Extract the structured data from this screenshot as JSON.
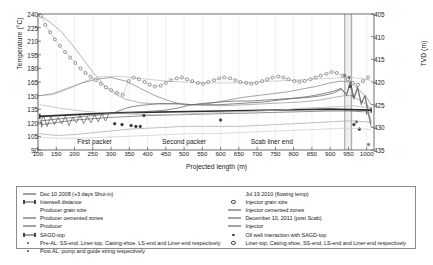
{
  "chart_data": {
    "type": "line",
    "title": "",
    "xlabel": "Projected length (m)",
    "ylabel": "Temperature (°C)",
    "y2label": "TVD (m)",
    "xlim": [
      100,
      1020
    ],
    "ylim": [
      90,
      240
    ],
    "y2lim": [
      405,
      435
    ],
    "y2_inverted": true,
    "grid": false,
    "legend_position": "below-plot-two-columns",
    "xticks": [
      100,
      150,
      200,
      250,
      300,
      350,
      400,
      450,
      500,
      550,
      600,
      650,
      700,
      750,
      800,
      850,
      900,
      950,
      1000
    ],
    "yticks": [
      90,
      105,
      120,
      135,
      150,
      165,
      180,
      195,
      210,
      225,
      240
    ],
    "y2ticks": [
      405,
      410,
      415,
      420,
      425,
      430,
      435
    ],
    "annotations": [
      {
        "text": "First packer",
        "x": 255,
        "y": 100
      },
      {
        "text": "Second packer",
        "x": 500,
        "y": 100
      },
      {
        "text": "Scab liner end",
        "x": 740,
        "y": 100
      }
    ],
    "series": [
      {
        "name": "Dec 10 2008 (+3 days Shut-in)",
        "style": "line",
        "color": "#9a9a9a",
        "x": [
          105,
          130,
          160,
          190,
          220,
          250,
          280,
          310,
          340,
          380,
          420,
          470,
          520,
          570,
          620,
          670,
          720,
          770,
          820,
          870,
          910,
          940,
          955,
          960,
          970,
          985,
          1000,
          1010
        ],
        "y": [
          238,
          232,
          222,
          208,
          192,
          176,
          162,
          152,
          146,
          142,
          141,
          141,
          140,
          139,
          139,
          140,
          141,
          142,
          143,
          145,
          148,
          150,
          150,
          149,
          147,
          144,
          140,
          136
        ]
      },
      {
        "name": "Interwell distance",
        "style": "line-with-end-caps",
        "color": "#6e6e6e",
        "x": [
          110,
          200,
          300,
          400,
          500,
          600,
          700,
          800,
          900,
          950,
          1000
        ],
        "y": [
          118,
          123,
          126,
          128,
          129,
          130,
          131,
          132,
          133,
          133,
          132
        ]
      },
      {
        "name": "Producer grain size",
        "style": "noisy-line",
        "color": "#3a3a3a",
        "x": [
          105,
          115,
          125,
          135,
          145,
          155,
          165,
          175,
          185,
          195,
          205,
          215,
          225,
          235,
          245,
          255,
          265,
          275,
          285,
          295,
          305,
          320,
          340,
          360,
          380,
          400,
          430,
          460,
          490,
          520,
          560,
          600,
          640,
          680,
          720,
          760,
          800,
          840,
          880,
          910,
          930,
          945,
          955,
          965,
          975,
          985,
          995,
          1005,
          1012
        ],
        "y": [
          118,
          128,
          116,
          127,
          118,
          126,
          119,
          127,
          117,
          126,
          120,
          128,
          119,
          127,
          120,
          129,
          121,
          130,
          122,
          131,
          130,
          133,
          136,
          138,
          139,
          140,
          141,
          141,
          141,
          140,
          140,
          140,
          141,
          142,
          143,
          145,
          147,
          149,
          152,
          155,
          158,
          150,
          166,
          148,
          160,
          142,
          150,
          132,
          120
        ]
      },
      {
        "name": "Producer cemented zones",
        "style": "line",
        "color": "#c2c2c2",
        "x": [
          105,
          140,
          170,
          200,
          230,
          260,
          280,
          290,
          300,
          330,
          360,
          400,
          450,
          500,
          550,
          600,
          650,
          700,
          750,
          800,
          850,
          900,
          940,
          960,
          1000,
          1012
        ],
        "y": [
          150,
          151,
          155,
          160,
          166,
          170,
          171,
          171,
          171,
          171,
          170,
          168,
          166,
          165,
          164,
          164,
          164,
          165,
          166,
          167,
          168,
          169,
          170,
          170,
          168,
          166
        ]
      },
      {
        "name": "Producer",
        "style": "line",
        "color": "#aaaaaa",
        "x": [
          105,
          150,
          200,
          250,
          300,
          350,
          400,
          450,
          500,
          550,
          600,
          650,
          700,
          750,
          800,
          850,
          900,
          940,
          960,
          1000,
          1012
        ],
        "y": [
          108,
          106,
          107,
          109,
          111,
          113,
          114,
          115,
          116,
          116,
          116,
          116,
          117,
          118,
          119,
          120,
          121,
          122,
          122,
          121,
          120
        ]
      },
      {
        "name": "SAGD-top",
        "style": "thick-line-with-caps",
        "color": "#2e2e2e",
        "x": [
          105,
          300,
          600,
          900,
          1012
        ],
        "y": [
          127,
          131,
          133,
          135,
          134
        ]
      },
      {
        "name": "Pre-AL: SS-end, Liner-top, Casing-shoe, LS-end and Liner-end respectively",
        "style": "markers",
        "color": "#2e2e2e",
        "x": [
          330,
          355,
          368,
          380,
          955
        ],
        "y": [
          118,
          117,
          116,
          116,
          160
        ]
      },
      {
        "name": "Post AL: pump and guide string respectively",
        "style": "markers",
        "color": "#2e2e2e",
        "x": [
          310,
          980
        ],
        "y": [
          119,
          113
        ]
      },
      {
        "name": "Jul 19 2010 (flowing temp)",
        "style": "line",
        "color": "#878787",
        "x": [
          105,
          140,
          180,
          220,
          260,
          300,
          340,
          380,
          420,
          460,
          500,
          540,
          580,
          620,
          660,
          700,
          740,
          780,
          820,
          860,
          900,
          930,
          950,
          965,
          980,
          1000,
          1012
        ],
        "y": [
          150,
          152,
          158,
          164,
          168,
          170,
          166,
          158,
          150,
          144,
          140,
          140,
          142,
          145,
          148,
          150,
          152,
          154,
          157,
          160,
          164,
          166,
          165,
          162,
          156,
          148,
          140
        ]
      },
      {
        "name": "Injector grain size",
        "style": "dotted-markers",
        "color": "#555555",
        "x": [
          108,
          120,
          133,
          146,
          160,
          174,
          188,
          202,
          216,
          230,
          244,
          258,
          272,
          286,
          300,
          316,
          332,
          348,
          362,
          376,
          392,
          406,
          420,
          436,
          450,
          464,
          480,
          494,
          508,
          522,
          538,
          552,
          566,
          582,
          596,
          610,
          626,
          640,
          654,
          670,
          684,
          698,
          714,
          728,
          742,
          758,
          772,
          786,
          802,
          816,
          830,
          846,
          860,
          874,
          890,
          904,
          918,
          934,
          948,
          962,
          976,
          990,
          1004
        ],
        "y": [
          238,
          228,
          220,
          212,
          205,
          198,
          192,
          186,
          180,
          175,
          171,
          167,
          163,
          159,
          156,
          153,
          151,
          166,
          170,
          168,
          165,
          162,
          160,
          161,
          164,
          167,
          169,
          170,
          168,
          166,
          164,
          163,
          165,
          167,
          169,
          170,
          169,
          167,
          165,
          164,
          163,
          164,
          166,
          168,
          170,
          171,
          170,
          168,
          166,
          165,
          166,
          168,
          170,
          172,
          174,
          176,
          175,
          172,
          168,
          164,
          162,
          166,
          170
        ]
      },
      {
        "name": "Injector cemented zones",
        "style": "line",
        "color": "#b5b5b5",
        "x": [
          105,
          160,
          220,
          280,
          340,
          400,
          460,
          520,
          580,
          640,
          700,
          760,
          820,
          880,
          930,
          960,
          1000,
          1012
        ],
        "y": [
          140,
          136,
          133,
          131,
          130,
          129,
          129,
          130,
          131,
          132,
          133,
          134,
          136,
          137,
          138,
          139,
          137,
          135
        ]
      },
      {
        "name": "December 10, 2011 (post Scab)",
        "style": "line",
        "color": "#5f5f5f",
        "x": [
          105,
          150,
          200,
          250,
          300,
          340,
          380,
          420,
          450,
          480,
          510,
          540,
          570,
          600,
          640,
          680,
          720,
          760,
          800,
          840,
          880,
          910,
          930,
          945,
          955,
          965,
          975,
          985,
          995,
          1005,
          1012
        ],
        "y": [
          122,
          124,
          126,
          128,
          130,
          131,
          132,
          133,
          134,
          136,
          139,
          141,
          142,
          143,
          144,
          144,
          145,
          146,
          147,
          148,
          150,
          153,
          157,
          152,
          163,
          146,
          158,
          140,
          150,
          128,
          116
        ]
      },
      {
        "name": "Injector",
        "style": "line",
        "color": "#cfcfcf",
        "x": [
          105,
          160,
          220,
          280,
          340,
          400,
          460,
          520,
          580,
          640,
          700,
          760,
          820,
          880,
          930,
          960,
          1000,
          1012
        ],
        "y": [
          104,
          103,
          103,
          104,
          105,
          106,
          107,
          108,
          108,
          109,
          110,
          111,
          112,
          113,
          114,
          114,
          113,
          112
        ]
      },
      {
        "name": "Oil well interaction with SAGD-top",
        "style": "markers",
        "color": "#3a3a3a",
        "x": [
          390,
          600,
          965
        ],
        "y": [
          128,
          123,
          118
        ]
      },
      {
        "name": "Liner-top, Casing-shoe, SS-end, LS-end and Liner-end respectively",
        "style": "markers",
        "color": "#777777",
        "x": [
          940,
          952,
          962,
          972,
          1005
        ],
        "y": [
          172,
          170,
          150,
          121,
          96
        ]
      }
    ]
  },
  "legend": {
    "left_column": [
      {
        "label": "Dec 10 2008 (+3 days Shut-in)",
        "key": "line-thin"
      },
      {
        "label": "Interwell distance",
        "key": "line-caps"
      },
      {
        "label": "Producer grain size",
        "key": "none"
      },
      {
        "label": "Producer cemented zones",
        "key": "line-thin"
      },
      {
        "label": "Producer",
        "key": "line-thin"
      },
      {
        "label": "SAGD-top",
        "key": "line-thick-caps"
      },
      {
        "label": "Pre-AL: SS-end, Liner-top, Casing-shoe, LS-end and Liner-end respectively",
        "key": "dot"
      },
      {
        "label": "Post AL: pump and guide string respectively",
        "key": "dot"
      }
    ],
    "right_column": [
      {
        "label": "Jul 19 2010 (flowing temp)",
        "key": "none"
      },
      {
        "label": "Injector grain size",
        "key": "dot-hollow"
      },
      {
        "label": "Injector cemented zones",
        "key": "line-thin"
      },
      {
        "label": "December 10, 2011 (post Scab)",
        "key": "line-thin"
      },
      {
        "label": "Injector",
        "key": "line-thin"
      },
      {
        "label": "Oil well interaction with SAGD-top",
        "key": "dot"
      },
      {
        "label": "Liner-top, Casing-shoe, SS-end, LS-end and Liner-end respectively",
        "key": "dot-hollow"
      }
    ]
  }
}
